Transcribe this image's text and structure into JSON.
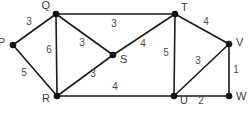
{
  "figure": {
    "background_color": "#ffffff",
    "node_color": "#111111",
    "edge_color": "#1a1a1a",
    "label_color": "#3a3a3a",
    "weight_color": "#4a4a4a",
    "width": 251,
    "height": 115
  },
  "chart_data": {
    "type": "diagram",
    "graph_type": "undirected-weighted-graph",
    "title": "",
    "nodes": [
      {
        "id": "P",
        "label": "P",
        "x": 13,
        "y": 45,
        "label_x": 5,
        "label_y": 43,
        "label_anchor": "end"
      },
      {
        "id": "Q",
        "label": "Q",
        "x": 56,
        "y": 14,
        "label_x": 50,
        "label_y": 6,
        "label_anchor": "end"
      },
      {
        "id": "R",
        "label": "R",
        "x": 57,
        "y": 96,
        "label_x": 50,
        "label_y": 99,
        "label_anchor": "end"
      },
      {
        "id": "S",
        "label": "S",
        "x": 113,
        "y": 55,
        "label_x": 120,
        "label_y": 60,
        "label_anchor": "start"
      },
      {
        "id": "T",
        "label": "T",
        "x": 175,
        "y": 14,
        "label_x": 181,
        "label_y": 8,
        "label_anchor": "start"
      },
      {
        "id": "U",
        "label": "U",
        "x": 174,
        "y": 96,
        "label_x": 180,
        "label_y": 101,
        "label_anchor": "start"
      },
      {
        "id": "V",
        "label": "V",
        "x": 229,
        "y": 44,
        "label_x": 236,
        "label_y": 43,
        "label_anchor": "start"
      },
      {
        "id": "W",
        "label": "W",
        "x": 229,
        "y": 96,
        "label_x": 236,
        "label_y": 97,
        "label_anchor": "start"
      }
    ],
    "edges": [
      {
        "from": "P",
        "to": "Q",
        "weight": "3",
        "x1": 13,
        "y1": 45,
        "x2": 56,
        "y2": 14,
        "wx": 29,
        "wy": 22
      },
      {
        "from": "P",
        "to": "R",
        "weight": "5",
        "x1": 13,
        "y1": 45,
        "x2": 57,
        "y2": 96,
        "wx": 24,
        "wy": 73
      },
      {
        "from": "Q",
        "to": "R",
        "weight": "6",
        "x1": 56,
        "y1": 14,
        "x2": 57,
        "y2": 96,
        "wx": 49,
        "wy": 50
      },
      {
        "from": "Q",
        "to": "S",
        "weight": "3",
        "x1": 56,
        "y1": 14,
        "x2": 113,
        "y2": 55,
        "wx": 82,
        "wy": 43
      },
      {
        "from": "Q",
        "to": "T",
        "weight": "3",
        "x1": 56,
        "y1": 14,
        "x2": 175,
        "y2": 14,
        "wx": 114,
        "wy": 24
      },
      {
        "from": "R",
        "to": "S",
        "weight": "3",
        "x1": 57,
        "y1": 96,
        "x2": 113,
        "y2": 55,
        "wx": 93,
        "wy": 74
      },
      {
        "from": "R",
        "to": "U",
        "weight": "4",
        "x1": 57,
        "y1": 96,
        "x2": 174,
        "y2": 96,
        "wx": 115,
        "wy": 87
      },
      {
        "from": "S",
        "to": "T",
        "weight": "4",
        "x1": 113,
        "y1": 55,
        "x2": 175,
        "y2": 14,
        "wx": 143,
        "wy": 44
      },
      {
        "from": "T",
        "to": "U",
        "weight": "5",
        "x1": 175,
        "y1": 14,
        "x2": 174,
        "y2": 96,
        "wx": 166,
        "wy": 53
      },
      {
        "from": "T",
        "to": "V",
        "weight": "4",
        "x1": 175,
        "y1": 14,
        "x2": 229,
        "y2": 44,
        "wx": 206,
        "wy": 22
      },
      {
        "from": "U",
        "to": "V",
        "weight": "3",
        "x1": 174,
        "y1": 96,
        "x2": 229,
        "y2": 44,
        "wx": 198,
        "wy": 61
      },
      {
        "from": "U",
        "to": "W",
        "weight": "2",
        "x1": 174,
        "y1": 96,
        "x2": 229,
        "y2": 96,
        "wx": 201,
        "wy": 101
      },
      {
        "from": "V",
        "to": "W",
        "weight": "1",
        "x1": 229,
        "y1": 44,
        "x2": 229,
        "y2": 96,
        "wx": 236,
        "wy": 70
      }
    ]
  }
}
